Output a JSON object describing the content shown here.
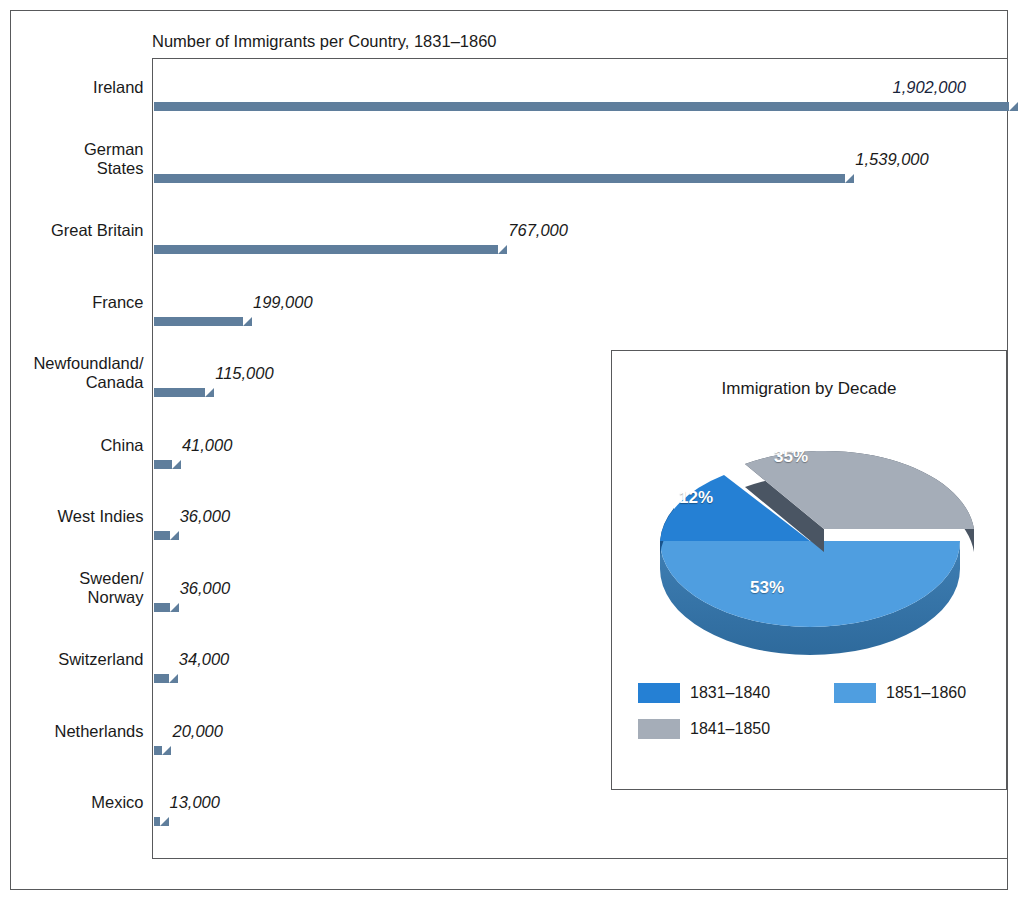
{
  "chart_data": [
    {
      "type": "bar",
      "title": "Number of Immigrants per Country, 1831–1860",
      "orientation": "horizontal",
      "xlabel": "",
      "ylabel": "",
      "xlim": [
        0,
        1902000
      ],
      "grid": false,
      "categories": [
        "Ireland",
        "German States",
        "Great Britain",
        "France",
        "Newfoundland/ Canada",
        "China",
        "West Indies",
        "Sweden/ Norway",
        "Switzerland",
        "Netherlands",
        "Mexico"
      ],
      "values": [
        1902000,
        1539000,
        767000,
        199000,
        115000,
        41000,
        36000,
        36000,
        34000,
        20000,
        13000
      ],
      "value_labels": [
        "1,902,000",
        "1,539,000",
        "767,000",
        "199,000",
        "115,000",
        "41,000",
        "36,000",
        "36,000",
        "34,000",
        "20,000",
        "13,000"
      ],
      "bar_color": "#8fbfe6",
      "bar_shadow_color": "#5f7e9c"
    },
    {
      "type": "pie",
      "title": "Immigration by Decade",
      "labels": [
        "1831–1840",
        "1851–1860",
        "1841–1850"
      ],
      "values": [
        12,
        53,
        35
      ],
      "value_labels": [
        "12%",
        "53%",
        "35%"
      ],
      "colors": [
        "#2580d4",
        "#4f9ee0",
        "#a5adb8"
      ],
      "exploded_slice": "1841–1850",
      "legend_position": "bottom"
    }
  ],
  "bar_chart": {
    "title": "Number of Immigrants per Country, 1831–1860",
    "rows": [
      {
        "label_line1": "Ireland",
        "label_line2": "",
        "value_label": "1,902,000"
      },
      {
        "label_line1": "German",
        "label_line2": "States",
        "value_label": "1,539,000"
      },
      {
        "label_line1": "Great Britain",
        "label_line2": "",
        "value_label": "767,000"
      },
      {
        "label_line1": "France",
        "label_line2": "",
        "value_label": "199,000"
      },
      {
        "label_line1": "Newfoundland/",
        "label_line2": "Canada",
        "value_label": "115,000"
      },
      {
        "label_line1": "China",
        "label_line2": "",
        "value_label": "41,000"
      },
      {
        "label_line1": "West Indies",
        "label_line2": "",
        "value_label": "36,000"
      },
      {
        "label_line1": "Sweden/",
        "label_line2": "Norway",
        "value_label": "36,000"
      },
      {
        "label_line1": "Switzerland",
        "label_line2": "",
        "value_label": "34,000"
      },
      {
        "label_line1": "Netherlands",
        "label_line2": "",
        "value_label": "20,000"
      },
      {
        "label_line1": "Mexico",
        "label_line2": "",
        "value_label": "13,000"
      }
    ]
  },
  "pie_chart": {
    "title": "Immigration by Decade",
    "slice_labels": {
      "dark_blue": "12%",
      "gray": "35%",
      "light_blue": "53%"
    },
    "legend": [
      {
        "label": "1831–1840",
        "color": "#2580d4"
      },
      {
        "label": "1851–1860",
        "color": "#4f9ee0"
      },
      {
        "label": "1841–1850",
        "color": "#a5adb8"
      }
    ]
  },
  "colors": {
    "bar_face": "#8fbfe6",
    "bar_shadow": "#5f7e9c",
    "pie_dark_blue": "#2580d4",
    "pie_light_blue": "#4f9ee0",
    "pie_gray": "#a5adb8",
    "frame": "#58595b",
    "text": "#1a1a1a"
  }
}
